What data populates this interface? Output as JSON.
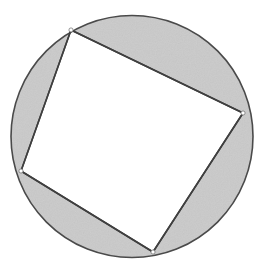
{
  "figure": {
    "type": "geometric-diagram",
    "canvas": {
      "width": 262,
      "height": 272,
      "background": "#ffffff"
    },
    "circle": {
      "name": "circumscribed-circle",
      "cx": 132,
      "cy": 136.5,
      "r": 121,
      "stroke": "#4a4a4a",
      "stroke_width": 1.6,
      "fill": "none"
    },
    "quadrilateral": {
      "name": "inscribed-quadrilateral",
      "vertex_count": 4,
      "fill": "#ffffff",
      "stroke": "#3f3f3f",
      "stroke_width": 1.6,
      "points": "71,30 243,113 153,252 21,171",
      "vertices": [
        {
          "label": "A",
          "x": 71,
          "y": 30,
          "position": "top-left"
        },
        {
          "label": "B",
          "x": 243,
          "y": 113,
          "position": "right"
        },
        {
          "label": "C",
          "x": 153,
          "y": 252,
          "position": "bottom"
        },
        {
          "label": "D",
          "x": 21,
          "y": 171,
          "position": "left"
        }
      ]
    },
    "shaded_segments": [
      {
        "name": "segment-top",
        "between_vertices": "A-B",
        "path": "M 71 30 A 121 121 0 0 1 243 113 L 71 30 Z",
        "fill": "#cacaca"
      },
      {
        "name": "segment-right",
        "between_vertices": "B-C",
        "path": "M 243 113 A 121 121 0 0 1 153 252 L 243 113 Z",
        "fill": "#cacaca"
      },
      {
        "name": "segment-bottom-left",
        "between_vertices": "C-D",
        "path": "M 153 252 A 121 121 0 0 1 21 171 L 153 252 Z",
        "fill": "#cacaca"
      },
      {
        "name": "segment-left",
        "between_vertices": "D-A",
        "path": "M 21 171 A 121 121 0 0 1 71 30 L 21 171 Z",
        "fill": "#cacaca"
      }
    ],
    "colors": {
      "shade": "#cacaca",
      "outline": "#4a4a4a",
      "interior": "#ffffff",
      "background": "#ffffff"
    }
  }
}
